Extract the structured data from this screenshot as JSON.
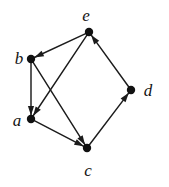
{
  "figure": {
    "kind": "directed-graph-diagram",
    "background_color": "#ffffff",
    "stroke_color": "#1c1c1c",
    "node_fill_color": "#111111",
    "width": 169,
    "height": 187
  },
  "graph": {
    "directed": true,
    "node_radius": 4.2,
    "nodes": [
      {
        "id": "a",
        "label": "a",
        "x": 31,
        "y": 119,
        "label_x": 17,
        "label_y": 120
      },
      {
        "id": "b",
        "label": "b",
        "x": 31,
        "y": 59,
        "label_x": 19,
        "label_y": 58
      },
      {
        "id": "c",
        "label": "c",
        "x": 87,
        "y": 148,
        "label_x": 88,
        "label_y": 170
      },
      {
        "id": "d",
        "label": "d",
        "x": 131,
        "y": 90,
        "label_x": 148,
        "label_y": 90
      },
      {
        "id": "e",
        "label": "e",
        "x": 89,
        "y": 32,
        "label_x": 86,
        "label_y": 15
      }
    ],
    "edges": [
      {
        "id": "e-b",
        "from": "e",
        "to": "b"
      },
      {
        "id": "e-a",
        "from": "e",
        "to": "a"
      },
      {
        "id": "b-a",
        "from": "b",
        "to": "a"
      },
      {
        "id": "b-c",
        "from": "b",
        "to": "c"
      },
      {
        "id": "a-c",
        "from": "a",
        "to": "c"
      },
      {
        "id": "c-d",
        "from": "c",
        "to": "d"
      },
      {
        "id": "d-e",
        "from": "d",
        "to": "e"
      }
    ]
  }
}
